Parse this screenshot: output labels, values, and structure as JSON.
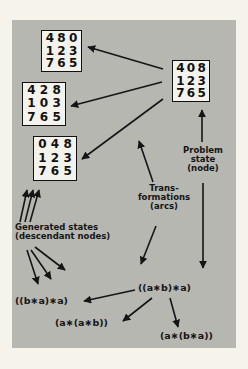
{
  "diagram": {
    "problem_state": {
      "label_lines": [
        "Problem",
        "state",
        "(node)"
      ],
      "grid": [
        "4",
        "0",
        "8",
        "1",
        "2",
        "3",
        "7",
        "6",
        "5"
      ]
    },
    "generated_states": [
      {
        "grid": [
          "4",
          "8",
          "0",
          "1",
          "2",
          "3",
          "7",
          "6",
          "5"
        ]
      },
      {
        "grid": [
          "4",
          "2",
          "8",
          "1",
          "0",
          "3",
          "7",
          "6",
          "5"
        ]
      },
      {
        "grid": [
          "0",
          "4",
          "8",
          "1",
          "2",
          "3",
          "7",
          "6",
          "5"
        ]
      }
    ],
    "generated_label_lines": [
      "Generated states",
      "(descendant nodes)"
    ],
    "transformations_label_lines": [
      "Trans-",
      "formations",
      "(arcs)"
    ],
    "expression_root": "((a∗b)∗a)",
    "expression_children": [
      "((b∗a)∗a)",
      "(a∗(a∗b))",
      "(a∗(b∗a))"
    ]
  }
}
